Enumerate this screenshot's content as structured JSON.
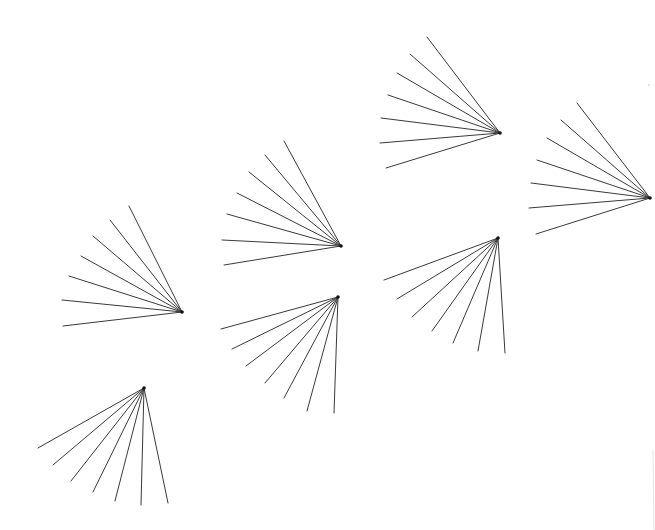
{
  "canvas": {
    "width": 655,
    "height": 530,
    "background": "#ffffff",
    "stroke_color": "#3a3a3a"
  },
  "fans": [
    {
      "id": "fan-1",
      "apex": [
        182,
        312
      ],
      "ends": [
        [
          63,
          326
        ],
        [
          62,
          300
        ],
        [
          69,
          276
        ],
        [
          81,
          256
        ],
        [
          93,
          236
        ],
        [
          110,
          220
        ],
        [
          129,
          206
        ]
      ]
    },
    {
      "id": "fan-2",
      "apex": [
        341,
        246
      ],
      "ends": [
        [
          224,
          265
        ],
        [
          222,
          240
        ],
        [
          227,
          214
        ],
        [
          237,
          193
        ],
        [
          249,
          172
        ],
        [
          265,
          155
        ],
        [
          284,
          141
        ]
      ]
    },
    {
      "id": "fan-3",
      "apex": [
        500,
        133
      ],
      "ends": [
        [
          386,
          168
        ],
        [
          380,
          143
        ],
        [
          381,
          118
        ],
        [
          388,
          95
        ],
        [
          397,
          73
        ],
        [
          410,
          54
        ],
        [
          427,
          37
        ]
      ]
    },
    {
      "id": "fan-4",
      "apex": [
        650,
        198
      ],
      "ends": [
        [
          536,
          234
        ],
        [
          529,
          208
        ],
        [
          531,
          183
        ],
        [
          537,
          160
        ],
        [
          547,
          138
        ],
        [
          561,
          120
        ],
        [
          577,
          103
        ]
      ]
    },
    {
      "id": "fan-5",
      "apex": [
        338,
        297
      ],
      "ends": [
        [
          221,
          329
        ],
        [
          232,
          349
        ],
        [
          246,
          366
        ],
        [
          265,
          383
        ],
        [
          284,
          398
        ],
        [
          307,
          411
        ],
        [
          334,
          413
        ]
      ]
    },
    {
      "id": "fan-6",
      "apex": [
        498,
        238
      ],
      "ends": [
        [
          384,
          280
        ],
        [
          397,
          299
        ],
        [
          412,
          317
        ],
        [
          432,
          331
        ],
        [
          453,
          343
        ],
        [
          478,
          351
        ],
        [
          505,
          353
        ]
      ]
    },
    {
      "id": "fan-7",
      "apex": [
        144,
        388
      ],
      "ends": [
        [
          38,
          448
        ],
        [
          53,
          465
        ],
        [
          71,
          481
        ],
        [
          93,
          492
        ],
        [
          115,
          501
        ],
        [
          141,
          505
        ],
        [
          168,
          503
        ]
      ]
    }
  ],
  "artifacts": {
    "faint_edge_line": [
      [
        653,
        450
      ],
      [
        654,
        530
      ]
    ],
    "faint_dot": [
      649,
      85
    ]
  }
}
